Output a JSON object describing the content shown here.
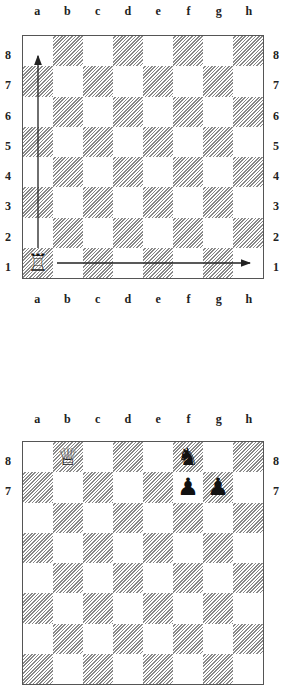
{
  "files": [
    "a",
    "b",
    "c",
    "d",
    "e",
    "f",
    "g",
    "h"
  ],
  "ranks": [
    "8",
    "7",
    "6",
    "5",
    "4",
    "3",
    "2",
    "1"
  ],
  "diagram1": {
    "pieces": [
      {
        "square": "a1",
        "piece": "rook",
        "color": "white",
        "glyph": "♖"
      }
    ],
    "arrows": [
      {
        "from": "a1",
        "to": "a8",
        "label": "rook vertical move"
      },
      {
        "from": "a1",
        "to": "h1",
        "label": "rook horizontal move"
      }
    ]
  },
  "diagram2": {
    "pieces": [
      {
        "square": "b8",
        "piece": "queen",
        "color": "white",
        "glyph": "♕"
      },
      {
        "square": "f8",
        "piece": "knight",
        "color": "black",
        "glyph": "♞"
      },
      {
        "square": "f7",
        "piece": "pawn",
        "color": "black",
        "glyph": "♟"
      },
      {
        "square": "g7",
        "piece": "pawn",
        "color": "black",
        "glyph": "♟"
      }
    ]
  }
}
